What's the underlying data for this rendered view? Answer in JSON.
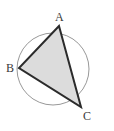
{
  "figure": {
    "background_color": "#ffffff",
    "canvas": {
      "width": 114,
      "height": 131
    },
    "circle": {
      "name": "circumscribed-circle",
      "cx": 53,
      "cy": 69,
      "r": 46,
      "stroke_color": "#8c8c8c",
      "stroke_width": 0.9,
      "fill": "none"
    },
    "triangle": {
      "name": "triangle-abc",
      "fill_color": "#dcdcdc",
      "stroke_color": "#2b2b2b",
      "stroke_width": 2.0,
      "points": "59,26 19,68 81,107"
    },
    "vertices": [
      {
        "id": "A",
        "label": "A",
        "x": 59,
        "y": 26,
        "label_x": 55,
        "label_y": 11
      },
      {
        "id": "B",
        "label": "B",
        "x": 19,
        "y": 68,
        "label_x": 6,
        "label_y": 62
      },
      {
        "id": "C",
        "label": "C",
        "x": 81,
        "y": 107,
        "label_x": 83,
        "label_y": 110
      }
    ],
    "label_color": "#3a3a3a",
    "label_font_size": 12
  }
}
